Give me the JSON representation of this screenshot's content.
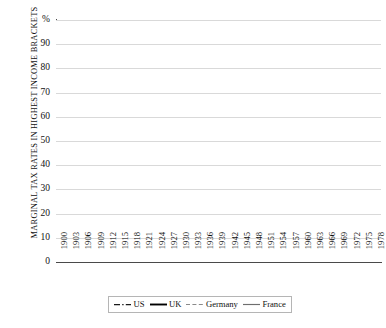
{
  "chart_data": {
    "type": "line",
    "title": "",
    "ylabel": "MARGINAL TAX RATES IN HIGHEST INCOME BRACKETS",
    "xlabel": "",
    "unit_label": "%",
    "ylim": [
      0,
      100
    ],
    "ytick_labels": [
      "%",
      "90",
      "80",
      "70",
      "60",
      "50",
      "40",
      "30",
      "20",
      "10",
      "0"
    ],
    "yticks": [
      100,
      90,
      80,
      70,
      60,
      50,
      40,
      30,
      20,
      10,
      0
    ],
    "grid": true,
    "legend_position": "bottom",
    "xlim": [
      1900,
      1980
    ],
    "tick_labels": [
      "1900",
      "1903",
      "1906",
      "1909",
      "1912",
      "1915",
      "1918",
      "1921",
      "1924",
      "1927",
      "1930",
      "1933",
      "1936",
      "1939",
      "1942",
      "1945",
      "1948",
      "1951",
      "1954",
      "1957",
      "1960",
      "1963",
      "1966",
      "1969",
      "1972",
      "1975",
      "1978"
    ],
    "tick_years": [
      1900,
      1903,
      1906,
      1909,
      1912,
      1915,
      1918,
      1921,
      1924,
      1927,
      1930,
      1933,
      1936,
      1939,
      1942,
      1945,
      1948,
      1951,
      1954,
      1957,
      1960,
      1963,
      1966,
      1969,
      1972,
      1975,
      1978
    ],
    "series": [
      {
        "name": "US",
        "style": "dash-dot",
        "color": "#1a1a1a",
        "points": [
          [
            1900,
            0
          ],
          [
            1912,
            0
          ],
          [
            1913,
            7
          ],
          [
            1915,
            7
          ],
          [
            1916,
            15
          ],
          [
            1917,
            67
          ],
          [
            1918,
            77
          ],
          [
            1919,
            73
          ],
          [
            1921,
            73
          ],
          [
            1922,
            58
          ],
          [
            1923,
            56
          ],
          [
            1924,
            46
          ],
          [
            1925,
            25
          ],
          [
            1928,
            25
          ],
          [
            1929,
            24
          ],
          [
            1930,
            25
          ],
          [
            1931,
            25
          ],
          [
            1932,
            63
          ],
          [
            1933,
            63
          ],
          [
            1935,
            63
          ],
          [
            1936,
            79
          ],
          [
            1937,
            79
          ],
          [
            1939,
            79
          ],
          [
            1940,
            81
          ],
          [
            1941,
            81
          ],
          [
            1942,
            88
          ],
          [
            1943,
            88
          ],
          [
            1944,
            94
          ],
          [
            1945,
            94
          ],
          [
            1946,
            91
          ],
          [
            1947,
            91
          ],
          [
            1948,
            82
          ],
          [
            1949,
            82
          ],
          [
            1950,
            84
          ],
          [
            1951,
            91
          ],
          [
            1952,
            92
          ],
          [
            1953,
            92
          ],
          [
            1954,
            91
          ],
          [
            1955,
            91
          ],
          [
            1963,
            91
          ],
          [
            1964,
            77
          ],
          [
            1965,
            70
          ],
          [
            1966,
            70
          ],
          [
            1967,
            70
          ],
          [
            1968,
            75
          ],
          [
            1969,
            77
          ],
          [
            1970,
            72
          ],
          [
            1971,
            70
          ],
          [
            1972,
            70
          ],
          [
            1978,
            70
          ]
        ]
      },
      {
        "name": "UK",
        "style": "solid-bold",
        "color": "#000000",
        "points": [
          [
            1900,
            0
          ],
          [
            1906,
            0
          ],
          [
            1907,
            8
          ],
          [
            1908,
            8
          ],
          [
            1913,
            8
          ],
          [
            1914,
            8
          ],
          [
            1915,
            21
          ],
          [
            1916,
            43
          ],
          [
            1917,
            50
          ],
          [
            1918,
            52
          ],
          [
            1919,
            52
          ],
          [
            1920,
            60
          ],
          [
            1921,
            60
          ],
          [
            1922,
            53
          ],
          [
            1923,
            50
          ],
          [
            1924,
            50
          ],
          [
            1925,
            50
          ],
          [
            1926,
            50
          ],
          [
            1927,
            50
          ],
          [
            1928,
            50
          ],
          [
            1929,
            50
          ],
          [
            1930,
            49
          ],
          [
            1931,
            50
          ],
          [
            1932,
            50
          ],
          [
            1933,
            50
          ],
          [
            1934,
            50
          ],
          [
            1935,
            53
          ],
          [
            1936,
            58
          ],
          [
            1937,
            62
          ],
          [
            1938,
            66
          ],
          [
            1939,
            67
          ],
          [
            1940,
            67
          ],
          [
            1941,
            64
          ],
          [
            1942,
            66
          ],
          [
            1943,
            78
          ],
          [
            1944,
            92
          ],
          [
            1945,
            98
          ],
          [
            1946,
            98
          ],
          [
            1951,
            98
          ],
          [
            1952,
            95
          ],
          [
            1953,
            92
          ],
          [
            1954,
            90
          ],
          [
            1955,
            89
          ],
          [
            1956,
            89
          ],
          [
            1958,
            89
          ],
          [
            1959,
            89
          ],
          [
            1961,
            89
          ],
          [
            1962,
            89
          ],
          [
            1964,
            89
          ],
          [
            1965,
            91
          ],
          [
            1966,
            91
          ],
          [
            1967,
            91
          ],
          [
            1968,
            91
          ],
          [
            1969,
            89
          ],
          [
            1970,
            89
          ],
          [
            1972,
            89
          ],
          [
            1973,
            98
          ],
          [
            1974,
            98
          ],
          [
            1978,
            98
          ]
        ]
      },
      {
        "name": "Germany",
        "style": "dashed-light",
        "color": "#6e6e6e",
        "points": [
          [
            1900,
            3
          ],
          [
            1912,
            3
          ],
          [
            1913,
            3
          ],
          [
            1914,
            3
          ],
          [
            1915,
            4
          ],
          [
            1916,
            4
          ],
          [
            1918,
            4
          ],
          [
            1919,
            40
          ],
          [
            1920,
            60
          ],
          [
            1921,
            60
          ],
          [
            1922,
            60
          ],
          [
            1923,
            60
          ],
          [
            1924,
            40
          ],
          [
            1925,
            40
          ],
          [
            1930,
            40
          ],
          [
            1931,
            40
          ],
          [
            1932,
            40
          ],
          [
            1933,
            40
          ],
          [
            1934,
            40
          ],
          [
            1935,
            40
          ],
          [
            1936,
            40
          ],
          [
            1937,
            40
          ],
          [
            1938,
            40
          ],
          [
            1939,
            65
          ],
          [
            1940,
            65
          ],
          [
            1941,
            65
          ],
          [
            1942,
            65
          ],
          [
            1943,
            65
          ],
          [
            1944,
            65
          ],
          [
            1945,
            65
          ],
          [
            1946,
            95
          ],
          [
            1947,
            95
          ],
          [
            1948,
            95
          ],
          [
            1949,
            95
          ],
          [
            1950,
            95
          ],
          [
            1951,
            80
          ],
          [
            1952,
            80
          ],
          [
            1953,
            80
          ],
          [
            1954,
            70
          ],
          [
            1955,
            63
          ],
          [
            1956,
            55
          ],
          [
            1957,
            53
          ],
          [
            1958,
            53
          ],
          [
            1959,
            53
          ],
          [
            1964,
            53
          ],
          [
            1965,
            53
          ],
          [
            1966,
            53
          ],
          [
            1967,
            53
          ],
          [
            1968,
            53
          ],
          [
            1969,
            53
          ],
          [
            1970,
            53
          ],
          [
            1971,
            53
          ],
          [
            1972,
            55
          ],
          [
            1973,
            56
          ],
          [
            1974,
            56
          ],
          [
            1975,
            56
          ],
          [
            1978,
            56
          ]
        ]
      },
      {
        "name": "France",
        "style": "solid-gray",
        "color": "#6e6e6e",
        "points": [
          [
            1900,
            0
          ],
          [
            1909,
            0
          ],
          [
            1910,
            3
          ],
          [
            1913,
            3
          ],
          [
            1914,
            3
          ],
          [
            1915,
            3
          ],
          [
            1916,
            20
          ],
          [
            1917,
            20
          ],
          [
            1918,
            20
          ],
          [
            1919,
            50
          ],
          [
            1920,
            50
          ],
          [
            1921,
            50
          ],
          [
            1922,
            50
          ],
          [
            1923,
            50
          ],
          [
            1924,
            72
          ],
          [
            1925,
            50
          ],
          [
            1926,
            50
          ],
          [
            1927,
            50
          ],
          [
            1928,
            30
          ],
          [
            1929,
            30
          ],
          [
            1930,
            30
          ],
          [
            1931,
            30
          ],
          [
            1932,
            30
          ],
          [
            1933,
            30
          ],
          [
            1934,
            24
          ],
          [
            1935,
            24
          ],
          [
            1936,
            24
          ],
          [
            1937,
            30
          ],
          [
            1938,
            33
          ],
          [
            1939,
            33
          ],
          [
            1940,
            33
          ],
          [
            1941,
            33
          ],
          [
            1942,
            33
          ],
          [
            1943,
            33
          ],
          [
            1944,
            25
          ],
          [
            1945,
            60
          ],
          [
            1946,
            63
          ],
          [
            1947,
            63
          ],
          [
            1948,
            63
          ],
          [
            1949,
            63
          ],
          [
            1950,
            63
          ],
          [
            1951,
            60
          ],
          [
            1952,
            60
          ],
          [
            1953,
            60
          ],
          [
            1954,
            60
          ],
          [
            1955,
            64
          ],
          [
            1956,
            60
          ],
          [
            1957,
            60
          ],
          [
            1958,
            64
          ],
          [
            1959,
            67
          ],
          [
            1960,
            67
          ],
          [
            1961,
            65
          ],
          [
            1962,
            62
          ],
          [
            1963,
            60
          ],
          [
            1964,
            60
          ],
          [
            1965,
            60
          ],
          [
            1970,
            60
          ],
          [
            1978,
            60
          ]
        ]
      }
    ]
  },
  "legend": {
    "items": [
      {
        "label": "US",
        "style": "dash-dot"
      },
      {
        "label": "UK",
        "style": "solid-bold"
      },
      {
        "label": "Germany",
        "style": "dashed-light"
      },
      {
        "label": "France",
        "style": "solid-gray"
      }
    ]
  },
  "colors": {
    "grid": "#d9d9d9",
    "axis": "#4a4a4a",
    "dark": "#1a1a1a",
    "gray": "#6e6e6e",
    "background": "#ffffff"
  }
}
